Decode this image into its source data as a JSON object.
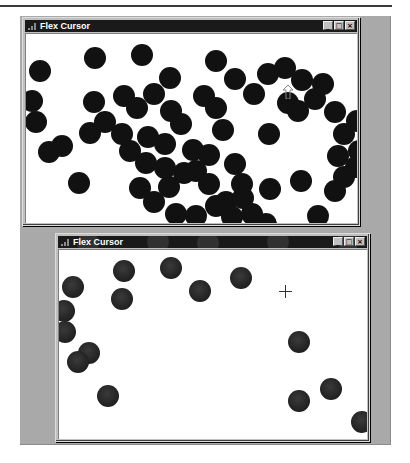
{
  "windows": [
    {
      "id": "top",
      "title": "Flex Cursor",
      "caption_buttons": {
        "minimize": "_",
        "maximize": "□",
        "close": "×"
      },
      "cursor": {
        "type": "arrow-up",
        "x": 262,
        "y": 58
      },
      "ball_radius": 11,
      "balls": [
        [
          14,
          37
        ],
        [
          69,
          24
        ],
        [
          116,
          21
        ],
        [
          190,
          27
        ],
        [
          144,
          44
        ],
        [
          6,
          67
        ],
        [
          10,
          88
        ],
        [
          23,
          118
        ],
        [
          36,
          112
        ],
        [
          53,
          149
        ],
        [
          68,
          68
        ],
        [
          64,
          99
        ],
        [
          79,
          88
        ],
        [
          98,
          62
        ],
        [
          111,
          74
        ],
        [
          96,
          100
        ],
        [
          122,
          103
        ],
        [
          104,
          117
        ],
        [
          128,
          60
        ],
        [
          145,
          77
        ],
        [
          155,
          90
        ],
        [
          139,
          110
        ],
        [
          120,
          129
        ],
        [
          114,
          154
        ],
        [
          128,
          168
        ],
        [
          143,
          153
        ],
        [
          158,
          139
        ],
        [
          139,
          134
        ],
        [
          167,
          116
        ],
        [
          178,
          62
        ],
        [
          190,
          74
        ],
        [
          197,
          96
        ],
        [
          183,
          121
        ],
        [
          170,
          137
        ],
        [
          183,
          150
        ],
        [
          209,
          130
        ],
        [
          200,
          168
        ],
        [
          217,
          164
        ],
        [
          216,
          150
        ],
        [
          209,
          45
        ],
        [
          228,
          60
        ],
        [
          242,
          40
        ],
        [
          259,
          34
        ],
        [
          276,
          46
        ],
        [
          262,
          69
        ],
        [
          272,
          77
        ],
        [
          289,
          65
        ],
        [
          297,
          50
        ],
        [
          309,
          78
        ],
        [
          318,
          100
        ],
        [
          331,
          87
        ],
        [
          312,
          122
        ],
        [
          333,
          117
        ],
        [
          330,
          133
        ],
        [
          318,
          143
        ],
        [
          309,
          157
        ],
        [
          243,
          100
        ],
        [
          244,
          155
        ],
        [
          275,
          147
        ],
        [
          292,
          182
        ],
        [
          150,
          180
        ],
        [
          170,
          182
        ],
        [
          190,
          172
        ],
        [
          240,
          190
        ],
        [
          226,
          180
        ],
        [
          206,
          183
        ]
      ]
    },
    {
      "id": "bottom",
      "title": "Flex Cursor",
      "caption_buttons": {
        "minimize": "_",
        "maximize": "□",
        "close": "×"
      },
      "cursor": {
        "type": "crosshair",
        "x": 226,
        "y": 41
      },
      "ball_radius": 11,
      "balls": [
        [
          65,
          21
        ],
        [
          112,
          18
        ],
        [
          141,
          41
        ],
        [
          182,
          28
        ],
        [
          14,
          37
        ],
        [
          63,
          49
        ],
        [
          5,
          61
        ],
        [
          6,
          82
        ],
        [
          30,
          103
        ],
        [
          19,
          112
        ],
        [
          49,
          146
        ],
        [
          240,
          92
        ],
        [
          272,
          139
        ],
        [
          240,
          151
        ],
        [
          303,
          172
        ]
      ],
      "title_ghosts": [
        [
          100,
          -4
        ],
        [
          150,
          -3
        ],
        [
          220,
          -4
        ],
        [
          290,
          -5
        ],
        [
          30,
          -3
        ]
      ]
    }
  ]
}
